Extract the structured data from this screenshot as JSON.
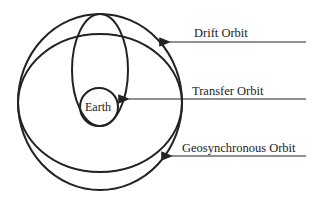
{
  "diagram": {
    "earth_label": "Earth",
    "labels": [
      {
        "id": "drift",
        "text": "Drift Orbit"
      },
      {
        "id": "transfer",
        "text": "Transfer Orbit"
      },
      {
        "id": "geo",
        "text": "Geosynchronous Orbit"
      }
    ],
    "colors": {
      "stroke": "#222222",
      "background": "#ffffff"
    }
  }
}
